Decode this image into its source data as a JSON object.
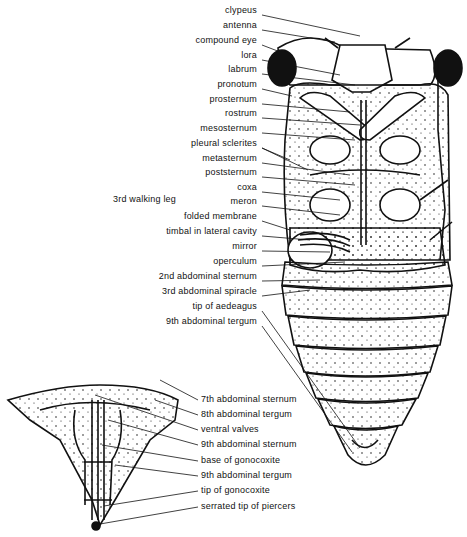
{
  "figure": {
    "main_labels": [
      {
        "text": "clypeus",
        "x": 230,
        "y": 10
      },
      {
        "text": "antenna",
        "x": 228,
        "y": 25
      },
      {
        "text": "compound   eye",
        "x": 230,
        "y": 40
      },
      {
        "text": "lora",
        "x": 228,
        "y": 55
      },
      {
        "text": "labrum",
        "x": 228,
        "y": 69
      },
      {
        "text": "pronotum",
        "x": 230,
        "y": 84
      },
      {
        "text": "prosternum",
        "x": 230,
        "y": 99
      },
      {
        "text": "rostrum",
        "x": 230,
        "y": 113
      },
      {
        "text": "mesosternum",
        "x": 230,
        "y": 128
      },
      {
        "text": "pleural   sclerites",
        "x": 230,
        "y": 143
      },
      {
        "text": "metasternum",
        "x": 230,
        "y": 158
      },
      {
        "text": "poststernum",
        "x": 230,
        "y": 172
      },
      {
        "text": "coxa",
        "x": 230,
        "y": 187
      },
      {
        "text": "meron",
        "x": 230,
        "y": 201
      },
      {
        "text": "folded   membrane",
        "x": 230,
        "y": 216
      },
      {
        "text": "timbal   in   lateral   cavity",
        "x": 230,
        "y": 231
      },
      {
        "text": "mirror",
        "x": 230,
        "y": 246
      },
      {
        "text": "operculum",
        "x": 230,
        "y": 261
      },
      {
        "text": "2nd   abdominal   sternum",
        "x": 230,
        "y": 276
      },
      {
        "text": "3rd   abdominal   spiracle",
        "x": 230,
        "y": 291
      },
      {
        "text": "tip   of   aedeagus",
        "x": 230,
        "y": 306
      },
      {
        "text": "9th   abdominal   tergum",
        "x": 230,
        "y": 321
      }
    ],
    "side_label": {
      "text": "3rd   walking   leg",
      "x": 113,
      "y": 198
    },
    "ovipositor_labels": [
      {
        "text": "7th   abdominal   sternum",
        "x": 200,
        "y": 395
      },
      {
        "text": "8th   abdominal   tergum",
        "x": 200,
        "y": 410
      },
      {
        "text": "ventral   valves",
        "x": 200,
        "y": 425
      },
      {
        "text": "9th   abdominal   sternum",
        "x": 200,
        "y": 440
      },
      {
        "text": "base   of   gonocoxite",
        "x": 200,
        "y": 456
      },
      {
        "text": "9th   abdominal   tergum",
        "x": 200,
        "y": 471
      },
      {
        "text": "tip   of   gonocoxite",
        "x": 200,
        "y": 486
      },
      {
        "text": "serrated   tip   of   piercers",
        "x": 200,
        "y": 502
      }
    ]
  }
}
